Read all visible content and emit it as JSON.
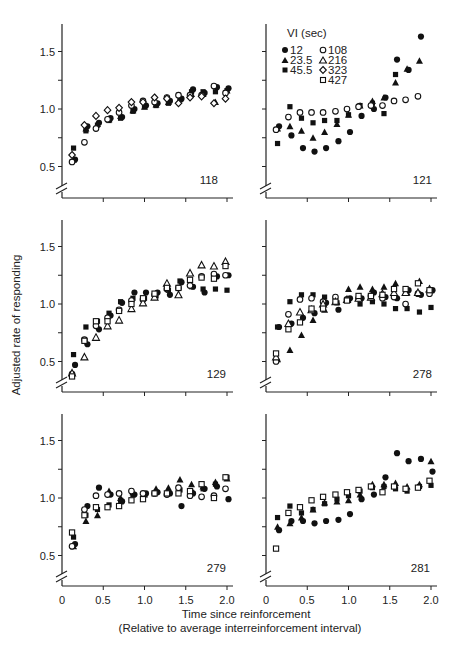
{
  "figure": {
    "ylabel": "Adjusted rate of responding",
    "xlabel_line1": "Time since reinforcement",
    "xlabel_line2": "(Relative to average interreinforcement interval)"
  },
  "legend": {
    "title": "VI (sec)",
    "items": [
      {
        "label": "12",
        "marker": "filled-circle"
      },
      {
        "label": "23.5",
        "marker": "filled-triangle"
      },
      {
        "label": "45.5",
        "marker": "filled-square"
      },
      {
        "label": "108",
        "marker": "open-circle"
      },
      {
        "label": "216",
        "marker": "open-triangle"
      },
      {
        "label": "323",
        "marker": "open-diamond"
      },
      {
        "label": "427",
        "marker": "open-square"
      }
    ]
  },
  "chart_data": {
    "type": "scatter",
    "title": "",
    "xlabel": "Time since reinforcement (Relative to average interreinforcement interval)",
    "ylabel": "Adjusted rate of responding",
    "xlim": [
      0,
      2.0
    ],
    "ylim": [
      0.3,
      1.75
    ],
    "x_ticks": [
      "0",
      "0.5",
      "1.0",
      "1.5",
      "2.0"
    ],
    "y_ticks": [
      "0.5",
      "1.0",
      "1.5"
    ],
    "grid": false,
    "legend_position": "inside top-left of panel 121",
    "x": [
      0.14,
      0.29,
      0.43,
      0.57,
      0.71,
      0.86,
      1.0,
      1.14,
      1.29,
      1.43,
      1.57,
      1.71,
      1.86,
      2.0
    ],
    "panels": [
      {
        "id": "118",
        "series": [
          {
            "name": "12",
            "values": [
              0.56,
              0.85,
              0.88,
              0.92,
              0.93,
              1.0,
              1.03,
              1.05,
              1.07,
              1.09,
              1.17,
              1.14,
              1.19,
              1.18
            ]
          },
          {
            "name": "23.5",
            "values": [
              0.56,
              0.83,
              0.87,
              0.91,
              0.94,
              0.99,
              1.02,
              1.04,
              1.06,
              1.09,
              1.13,
              1.13,
              1.06,
              1.16
            ]
          },
          {
            "name": "45.5",
            "values": [
              0.66,
              0.81,
              0.86,
              0.9,
              0.92,
              0.98,
              1.02,
              1.03,
              1.05,
              1.08,
              1.15,
              1.15,
              1.15,
              1.16
            ]
          },
          {
            "name": "108",
            "values": [
              0.54,
              0.71,
              0.83,
              0.91,
              0.97,
              1.03,
              1.07,
              1.06,
              1.1,
              1.12,
              1.12,
              1.12,
              1.2,
              1.14
            ]
          },
          {
            "name": "323",
            "values": [
              0.6,
              0.86,
              0.94,
              0.99,
              1.01,
              1.06,
              1.06,
              1.1,
              1.09,
              1.05,
              1.1,
              1.11,
              1.05,
              1.09
            ]
          }
        ]
      },
      {
        "id": "121",
        "series": [
          {
            "name": "12",
            "values": [
              0.85,
              0.77,
              0.66,
              0.63,
              0.66,
              0.72,
              0.8,
              0.94,
              1.0,
              1.1,
              1.43,
              1.34,
              1.63,
              null
            ]
          },
          {
            "name": "23.5",
            "values": [
              0.83,
              0.85,
              0.81,
              0.75,
              0.8,
              0.87,
              0.95,
              1.03,
              1.07,
              1.1,
              1.23,
              1.35,
              1.42,
              null
            ]
          },
          {
            "name": "45.5",
            "values": [
              0.7,
              1.02,
              0.92,
              0.88,
              0.9,
              0.9,
              0.95,
              1.03,
              1.05,
              0.96,
              1.3,
              null,
              null,
              null
            ]
          },
          {
            "name": "108",
            "values": [
              0.82,
              0.93,
              0.97,
              0.97,
              0.97,
              0.98,
              1.0,
              1.02,
              1.03,
              1.03,
              1.07,
              1.08,
              1.11,
              null
            ]
          }
        ]
      },
      {
        "id": "129",
        "series": [
          {
            "name": "12",
            "values": [
              0.47,
              0.65,
              0.78,
              0.9,
              1.01,
              1.1,
              1.1,
              1.1,
              1.08,
              1.19,
              1.15,
              1.1,
              1.24,
              1.25
            ]
          },
          {
            "name": "45.5",
            "values": [
              0.56,
              0.8,
              0.85,
              0.92,
              1.02,
              1.05,
              1.05,
              1.07,
              1.12,
              1.2,
              1.15,
              1.13,
              1.13,
              1.12
            ]
          },
          {
            "name": "108",
            "values": [
              0.39,
              0.69,
              0.81,
              0.88,
              0.95,
              1.03,
              1.04,
              1.08,
              1.13,
              1.14,
              1.16,
              1.24,
              1.26,
              1.25
            ]
          },
          {
            "name": "216",
            "values": [
              0.4,
              0.54,
              0.71,
              0.81,
              0.86,
              0.96,
              1.01,
              1.06,
              1.18,
              1.08,
              1.27,
              1.34,
              1.33,
              1.37
            ]
          },
          {
            "name": "427",
            "values": [
              0.37,
              0.68,
              0.85,
              0.85,
              0.94,
              1.0,
              1.05,
              1.09,
              1.14,
              1.14,
              1.21,
              1.23,
              1.22,
              1.33
            ]
          }
        ]
      },
      {
        "id": "278",
        "series": [
          {
            "name": "12",
            "values": [
              0.8,
              0.83,
              0.88,
              0.92,
              1.01,
              0.95,
              1.05,
              1.05,
              1.1,
              1.06,
              1.05,
              1.12,
              1.08,
              1.12
            ]
          },
          {
            "name": "23.5",
            "values": [
              0.52,
              0.6,
              0.73,
              0.86,
              0.95,
              1.02,
              1.13,
              1.15,
              1.13,
              1.15,
              1.18,
              1.1,
              1.2,
              1.12
            ]
          },
          {
            "name": "45.5",
            "values": [
              0.8,
              1.02,
              1.08,
              1.08,
              1.06,
              1.01,
              1.04,
              1.0,
              1.02,
              1.0,
              0.96,
              0.96,
              0.93,
              0.97
            ]
          },
          {
            "name": "108",
            "values": [
              0.5,
              0.91,
              1.04,
              1.05,
              1.02,
              1.06,
              1.04,
              1.05,
              1.07,
              1.05,
              1.06,
              1.0,
              1.09,
              1.09
            ]
          },
          {
            "name": "216",
            "values": [
              0.54,
              0.83,
              0.93,
              0.95,
              1.0,
              1.02,
              1.04,
              1.05,
              1.06,
              1.09,
              1.1,
              1.1,
              1.1,
              1.13
            ]
          },
          {
            "name": "427",
            "values": [
              0.57,
              0.78,
              0.84,
              0.96,
              0.96,
              1.02,
              1.03,
              1.07,
              1.07,
              1.08,
              1.13,
              1.13,
              1.18,
              1.12
            ]
          }
        ]
      },
      {
        "id": "279",
        "series": [
          {
            "name": "12",
            "values": [
              0.6,
              0.93,
              1.09,
              1.03,
              0.97,
              1.03,
              1.04,
              1.05,
              1.04,
              0.93,
              1.04,
              1.08,
              1.1,
              0.99
            ]
          },
          {
            "name": "23.5",
            "values": [
              0.58,
              0.8,
              0.85,
              1.06,
              1.0,
              1.05,
              1.03,
              1.08,
              1.09,
              1.16,
              1.12,
              1.1,
              1.14,
              1.17
            ]
          },
          {
            "name": "45.5",
            "values": [
              0.66,
              0.85,
              0.9,
              0.94,
              0.98,
              1.03,
              1.03,
              1.05,
              1.05,
              1.07,
              1.05,
              1.08,
              1.12,
              1.18
            ]
          },
          {
            "name": "108",
            "values": [
              0.58,
              0.9,
              1.02,
              1.03,
              1.04,
              1.06,
              1.04,
              1.04,
              1.03,
              1.09,
              1.02,
              1.01,
              1.02,
              1.08
            ]
          },
          {
            "name": "427",
            "values": [
              0.7,
              0.85,
              0.92,
              0.92,
              0.93,
              0.98,
              0.99,
              1.04,
              1.04,
              1.04,
              1.06,
              1.12,
              1.0,
              1.18
            ]
          }
        ]
      },
      {
        "id": "281",
        "series": [
          {
            "name": "12",
            "values": [
              0.72,
              0.8,
              0.8,
              0.78,
              0.8,
              0.81,
              0.86,
              0.99,
              1.03,
              1.18,
              1.39,
              1.32,
              1.34,
              1.23
            ]
          },
          {
            "name": "23.5",
            "values": [
              0.75,
              0.78,
              0.83,
              0.9,
              0.96,
              0.97,
              0.98,
              1.03,
              1.12,
              1.12,
              1.13,
              1.1,
              1.12,
              1.32
            ]
          },
          {
            "name": "45.5",
            "values": [
              0.83,
              0.93,
              0.87,
              0.9,
              0.95,
              0.99,
              1.02,
              1.06,
              1.09,
              1.1,
              1.08,
              1.06,
              1.1,
              1.11
            ]
          },
          {
            "name": "427",
            "values": [
              0.56,
              0.87,
              0.92,
              0.98,
              1.01,
              1.03,
              1.05,
              1.07,
              1.1,
              1.05,
              1.1,
              1.08,
              1.09,
              1.15
            ]
          }
        ]
      }
    ]
  },
  "panels": {
    "p118": {
      "id": "118"
    },
    "p121": {
      "id": "121"
    },
    "p129": {
      "id": "129"
    },
    "p278": {
      "id": "278"
    },
    "p279": {
      "id": "279"
    },
    "p281": {
      "id": "281"
    }
  },
  "ticks": {
    "y": [
      "0.5",
      "1.0",
      "1.5"
    ],
    "x": [
      "0",
      "0.5",
      "1.0",
      "1.5",
      "2.0"
    ]
  }
}
